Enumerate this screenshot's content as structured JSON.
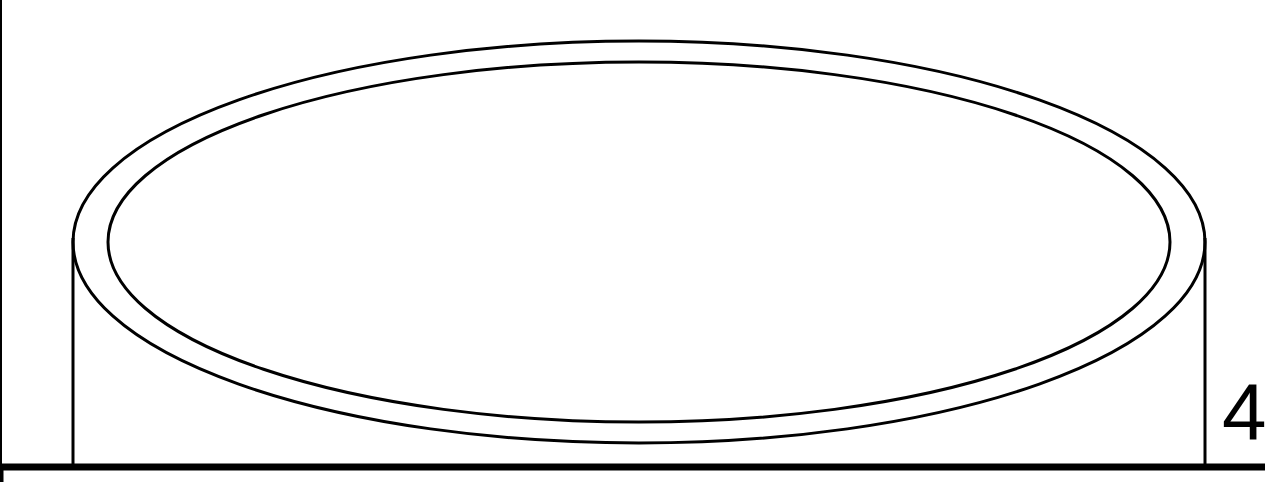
{
  "diagram": {
    "type": "cylinder-top-view-drawing",
    "label": "4",
    "colors": {
      "stroke": "#000000",
      "background": "#ffffff"
    },
    "shapes": {
      "outer_ellipse": {
        "cx": 639,
        "cy": 242,
        "rx": 566,
        "ry": 201
      },
      "inner_ellipse": {
        "cx": 639,
        "cy": 242,
        "rx": 531,
        "ry": 180
      },
      "left_wall_x": 73,
      "right_wall_x": 1205,
      "base_line_y": 466
    }
  }
}
